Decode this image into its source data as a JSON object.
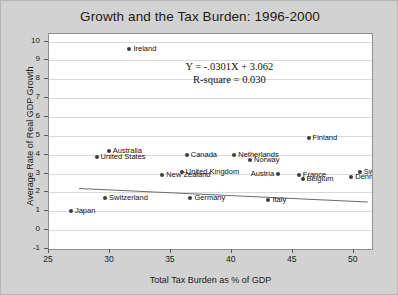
{
  "chart_data": {
    "type": "scatter",
    "title": "Growth and the Tax Burden: 1996-2000",
    "xlabel": "Total Tax Burden as % of GDP",
    "ylabel": "Average Rate of Real GDP Growth",
    "xlim": [
      25,
      51.5
    ],
    "ylim": [
      -1,
      10.4
    ],
    "xticks": [
      25,
      30,
      35,
      40,
      45,
      50
    ],
    "yticks": [
      -1,
      0,
      1,
      2,
      3,
      4,
      5,
      6,
      7,
      8,
      9,
      10
    ],
    "grid": true,
    "legend": "none",
    "annotations": {
      "equation": "Y = -.0301X + 3.062",
      "r_square": "R-square = 0.030"
    },
    "trendline": {
      "slope": -0.0301,
      "intercept": 3.062,
      "x_start": 27.5,
      "x_end": 51.2,
      "color": "#6b6b6b"
    },
    "marker_color": "#3c3c3c",
    "points": [
      {
        "name": "Ireland",
        "x": 31.6,
        "y": 9.6,
        "label_side": "right"
      },
      {
        "name": "Finland",
        "x": 46.3,
        "y": 4.9,
        "label_side": "right"
      },
      {
        "name": "Australia",
        "x": 29.9,
        "y": 4.2,
        "label_side": "right"
      },
      {
        "name": "United States",
        "x": 28.9,
        "y": 3.9,
        "label_side": "right"
      },
      {
        "name": "Canada",
        "x": 36.3,
        "y": 4.0,
        "label_side": "right"
      },
      {
        "name": "Netherlands",
        "x": 40.2,
        "y": 4.0,
        "label_side": "right"
      },
      {
        "name": "Norway",
        "x": 41.5,
        "y": 3.7,
        "label_side": "right"
      },
      {
        "name": "United Kingdom",
        "x": 35.9,
        "y": 3.1,
        "label_side": "right"
      },
      {
        "name": "New Zealand",
        "x": 34.3,
        "y": 2.9,
        "label_side": "right"
      },
      {
        "name": "Austria",
        "x": 43.8,
        "y": 3.0,
        "label_side": "left"
      },
      {
        "name": "Sweden",
        "x": 50.5,
        "y": 3.1,
        "label_side": "right"
      },
      {
        "name": "Denmark",
        "x": 49.8,
        "y": 2.8,
        "label_side": "right"
      },
      {
        "name": "France",
        "x": 45.5,
        "y": 2.9,
        "label_side": "right"
      },
      {
        "name": "Belgium",
        "x": 45.8,
        "y": 2.7,
        "label_side": "right"
      },
      {
        "name": "Switzerland",
        "x": 29.6,
        "y": 1.7,
        "label_side": "right"
      },
      {
        "name": "Germany",
        "x": 36.6,
        "y": 1.7,
        "label_side": "right"
      },
      {
        "name": "Italy",
        "x": 43.0,
        "y": 1.6,
        "label_side": "right"
      },
      {
        "name": "Japan",
        "x": 26.8,
        "y": 1.0,
        "label_side": "right"
      }
    ]
  }
}
